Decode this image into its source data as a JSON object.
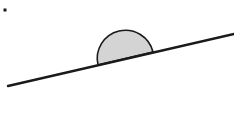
{
  "diagram": {
    "colors": {
      "background": "#ffffff",
      "stroke": "#1a1a1a",
      "hemisphere_fill": "#d4d4d4"
    },
    "incline": {
      "x1": 8,
      "y1": 86,
      "x2": 234,
      "y2": 34,
      "stroke_width": 2.4
    },
    "hemisphere": {
      "chord_start": [
        98,
        65
      ],
      "chord_end": [
        153,
        52
      ],
      "radius": 28.2,
      "stroke_width": 1.6
    },
    "marker_dot": {
      "x": 3.5,
      "y": 8.5,
      "size": 3
    }
  }
}
